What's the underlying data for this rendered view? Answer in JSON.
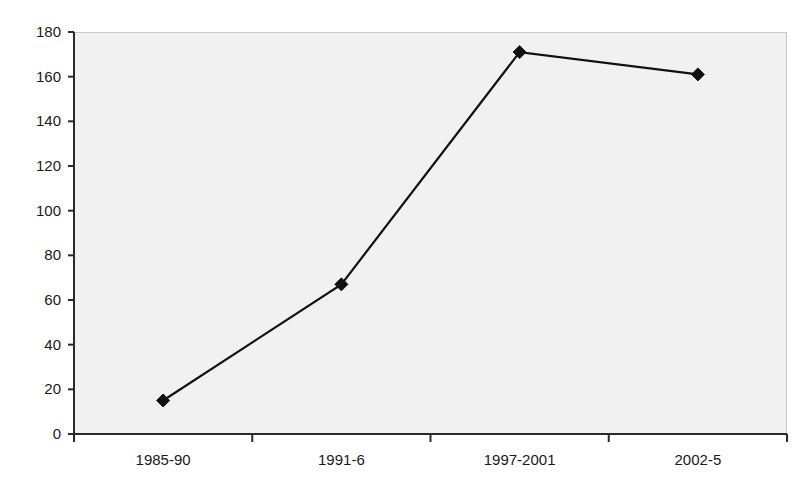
{
  "chart_data": {
    "type": "line",
    "title": "",
    "subtitle": "",
    "xlabel": "",
    "ylabel": "",
    "categories": [
      "1985-90",
      "1991-6",
      "1997-2001",
      "2002-5"
    ],
    "values": [
      15,
      67,
      171,
      161
    ],
    "series": [
      {
        "name": "",
        "values": [
          15,
          67,
          171,
          161
        ]
      }
    ],
    "ylim": [
      0,
      180
    ],
    "yticks": [
      0,
      20,
      40,
      60,
      80,
      100,
      120,
      140,
      160,
      180
    ],
    "ytick_labels": [
      "0",
      "20",
      "40",
      "60",
      "80",
      "100",
      "120",
      "140",
      "160",
      "180"
    ],
    "xtick_labels": [
      "1985-90",
      "1991-6",
      "1997-2001",
      "2002-5"
    ],
    "grid": false,
    "legend": "none",
    "marker": "diamond",
    "marker_color": "#111111",
    "line_color": "#111111",
    "plot_background": "#f1f1f1",
    "figure_background": "#ffffff",
    "axis_color": "#2b2b2b"
  }
}
